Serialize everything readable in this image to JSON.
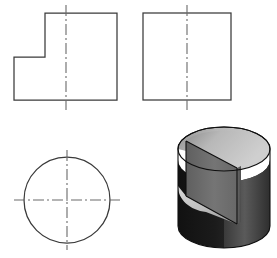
{
  "drawing": {
    "title": "Multiview orthographic drawing with isometric pictorial",
    "sheet_width": 277,
    "sheet_height": 258,
    "background_color": "#ffffff",
    "line_color": "#3a3a3a",
    "centerline_color": "#6a6a6a",
    "projection": "third-angle",
    "views": [
      {
        "id": "front-view",
        "name": "Front View",
        "shape": "stepped-rectangle",
        "description": "Rectangle with rectangular notch removed from lower-left corner",
        "outline_points": "14,100 14,57 45,57 45,13 117,13 117,100",
        "bounds": {
          "x": 14,
          "y": 13,
          "width": 103,
          "height": 87
        },
        "notch": {
          "x": 14,
          "y": 57,
          "width": 31,
          "height": 43
        },
        "centerline": {
          "orientation": "vertical",
          "x": 66,
          "y1": 5,
          "y2": 110
        }
      },
      {
        "id": "side-view",
        "name": "Side View",
        "shape": "rectangle",
        "description": "Plain rectangle the same height as the front view",
        "bounds": {
          "x": 143,
          "y": 13,
          "width": 88,
          "height": 87
        },
        "centerline": {
          "orientation": "vertical",
          "x": 187,
          "y1": 5,
          "y2": 110
        }
      },
      {
        "id": "top-view",
        "name": "Top View",
        "shape": "circle",
        "description": "Circle with crossing horizontal and vertical centerlines",
        "center": {
          "cx": 67,
          "cy": 200
        },
        "radius": 43,
        "centerlines": [
          {
            "orientation": "vertical",
            "x": 67,
            "y1": 150,
            "y2": 250
          },
          {
            "orientation": "horizontal",
            "y": 200,
            "x1": 14,
            "x2": 120
          }
        ]
      },
      {
        "id": "pictorial-view",
        "name": "Isometric Pictorial",
        "shape": "notched-cylinder",
        "description": "Shaded isometric cylinder with a rectangular notch cut into the upper front-left quadrant",
        "bounds": {
          "x": 178,
          "y": 127,
          "width": 92,
          "height": 125
        },
        "faces": [
          {
            "name": "top-face",
            "shade": "light-gray",
            "color": "#b9b9b9"
          },
          {
            "name": "notch-vertical-face",
            "shade": "medium-gray",
            "color": "#6e6e6e"
          },
          {
            "name": "notch-floor-face",
            "shade": "light-gray",
            "color": "#c4c4c4"
          },
          {
            "name": "cylinder-side-left",
            "shade": "dark",
            "color": "#1d1d1d"
          },
          {
            "name": "cylinder-side-right",
            "shade": "medium-dark",
            "color": "#4a4a4a"
          }
        ]
      }
    ]
  }
}
